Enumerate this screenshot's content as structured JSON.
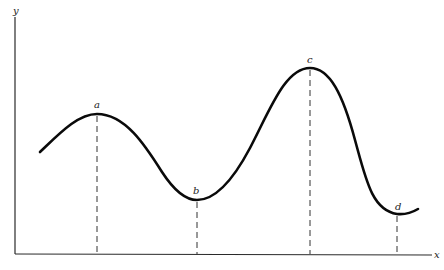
{
  "figure": {
    "type": "function-curve-extrema",
    "axes": {
      "x_label": "x",
      "y_label": "y"
    },
    "points": [
      {
        "id": "a",
        "label": "a",
        "kind": "local-maximum"
      },
      {
        "id": "b",
        "label": "b",
        "kind": "local-minimum"
      },
      {
        "id": "c",
        "label": "c",
        "kind": "local-maximum (highest)"
      },
      {
        "id": "d",
        "label": "d",
        "kind": "local-minimum (lowest)"
      }
    ],
    "colors": {
      "curve": "#0a0a0a",
      "axes": "#2a2a2a",
      "guides": "#333333",
      "background": "#ffffff"
    }
  }
}
